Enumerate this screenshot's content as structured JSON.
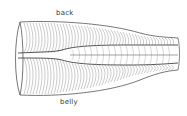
{
  "diagram": {
    "labels": {
      "top": "back",
      "bottom": "belly"
    },
    "colors": {
      "stroke": "#555555",
      "segment_stroke": "#8a8a8a",
      "label": "#3a3a3a",
      "background": "#ffffff"
    }
  }
}
